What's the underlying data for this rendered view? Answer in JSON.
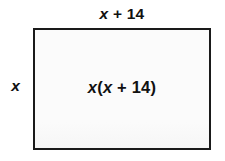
{
  "figure": {
    "type": "area-model-rectangle",
    "top_label": "x + 14",
    "left_label": "x",
    "area_label": "x(x + 14)",
    "colors": {
      "border": "#1a1a1a",
      "fill": "#fbfbfb",
      "text": "#111111",
      "background": "#ffffff"
    }
  },
  "chart_data": {
    "type": "diagram",
    "shape": "rectangle",
    "title": "",
    "width_expression": "x + 14",
    "height_expression": "x",
    "area_expression": "x(x + 14)",
    "annotations": [
      {
        "position": "top",
        "text": "x + 14"
      },
      {
        "position": "left",
        "text": "x"
      },
      {
        "position": "center",
        "text": "x(x + 14)"
      }
    ]
  }
}
